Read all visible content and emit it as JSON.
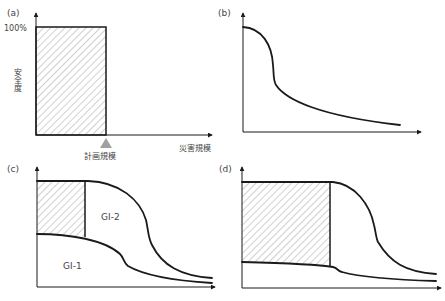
{
  "panels": {
    "a": {
      "label": "(a)",
      "y_tick_100": "100%",
      "y_axis_label": "安全度",
      "x_axis_label": "災害規模",
      "marker_label": "計画規模"
    },
    "b": {
      "label": "(b)"
    },
    "c": {
      "label": "(c)",
      "region_upper": "GI-2",
      "region_lower": "GI-1"
    },
    "d": {
      "label": "(d)"
    }
  },
  "colors": {
    "line": "#1a1a1a",
    "hatch": "#8a8a8a",
    "marker": "#a0a0a0",
    "text": "#444444"
  }
}
